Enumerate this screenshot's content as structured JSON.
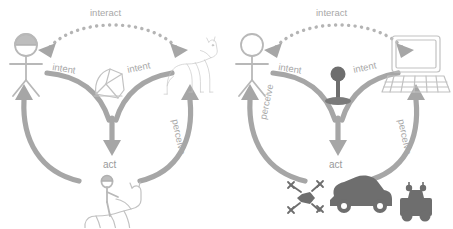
{
  "figure": {
    "panel_count": 2,
    "stroke_color": "#a6a6a6",
    "label_color": "#a8a8a8",
    "icon_color": "#bdbdbd",
    "accent_dark": "#6e6e6e",
    "background": "#ffffff"
  },
  "panels": [
    {
      "id": "horse-riding",
      "name": "horse-riding-panel",
      "labels": {
        "interact": "interact",
        "intent_left": "intent",
        "intent_right": "intent",
        "act": "act",
        "perceive": "perceive"
      },
      "nodes": {
        "operator": {
          "name": "rider-stick-figure",
          "icon": "person-with-helmet-icon"
        },
        "agent": {
          "name": "horse",
          "icon": "horse-icon"
        },
        "interface": {
          "name": "saddle-bridle",
          "icon": "saddle-icon"
        },
        "outcome": {
          "name": "rider-on-horse",
          "icon": "horse-and-rider-icon"
        }
      }
    },
    {
      "id": "vehicle-teleoperation",
      "name": "vehicle-teleoperation-panel",
      "labels": {
        "interact": "interact",
        "intent_left": "intent",
        "intent_right": "intent",
        "act": "act",
        "perceive": "perceive"
      },
      "nodes": {
        "operator": {
          "name": "operator-stick-figure",
          "icon": "person-icon"
        },
        "agent": {
          "name": "computer",
          "icon": "laptop-icon"
        },
        "interface": {
          "name": "joystick",
          "icon": "joystick-icon"
        },
        "outcome": {
          "name": "vehicles",
          "icon": "drone-car-rover-icon"
        }
      }
    }
  ]
}
